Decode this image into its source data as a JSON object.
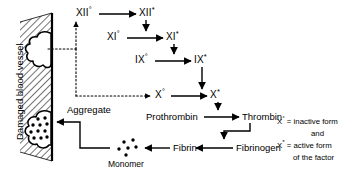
{
  "figure": {
    "vessel_label": "Damaged blood vessel",
    "colors": {
      "ink": "#000000",
      "background": "#ffffff",
      "hatch": "#000000"
    }
  },
  "cascade": {
    "rows": [
      {
        "inactive": "XII",
        "inactive_sup": "°",
        "active": "XII",
        "active_sup": "*"
      },
      {
        "inactive": "XI",
        "inactive_sup": "°",
        "active": "XI",
        "active_sup": "*"
      },
      {
        "inactive": "IX",
        "inactive_sup": "°",
        "active": "IX",
        "active_sup": "*"
      },
      {
        "inactive": "X",
        "inactive_sup": "°",
        "active": "X",
        "active_sup": "*"
      }
    ]
  },
  "nodes": {
    "xii_inactive": "XII",
    "xii_active": "XII",
    "xi_inactive": "XI",
    "xi_active": "XI",
    "ix_inactive": "IX",
    "ix_active": "IX",
    "x_inactive": "X",
    "x_active": "X",
    "prothrombin": "Prothrombin",
    "thrombin": "Thrombin",
    "fibrinogen": "Fibrinogen",
    "fibrin": "Fibrin",
    "monomer": "Monomer",
    "aggregate": "Aggregate",
    "sup_inactive": "°",
    "sup_active": "*"
  },
  "legend": {
    "line1_symbol": "X",
    "line1_sup": "°",
    "line1_text": "= inactive form",
    "line2_text": "and",
    "line3_symbol": "X",
    "line3_sup": "*",
    "line3_text": "= active form",
    "line4_text": "of the factor"
  }
}
